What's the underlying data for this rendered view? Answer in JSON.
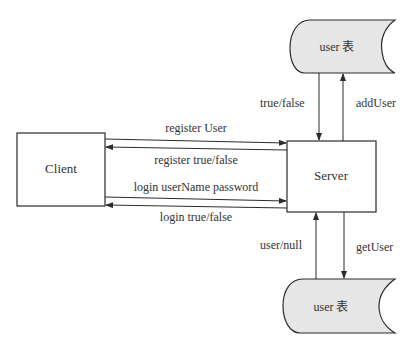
{
  "nodes": {
    "client": {
      "label": "Client"
    },
    "server": {
      "label": "Server"
    },
    "db_top": {
      "label": "user 表"
    },
    "db_bottom": {
      "label": "user 表"
    }
  },
  "edges": {
    "register_request": {
      "label": "register User",
      "from": "Client",
      "to": "Server"
    },
    "register_response": {
      "label": "register true/false",
      "from": "Server",
      "to": "Client"
    },
    "login_request": {
      "label": "login userName password",
      "from": "Client",
      "to": "Server"
    },
    "login_response": {
      "label": "login true/false",
      "from": "Server",
      "to": "Client"
    },
    "top_db_response": {
      "label": "true/false",
      "from": "user 表",
      "to": "Server"
    },
    "top_db_request": {
      "label": "addUser",
      "from": "Server",
      "to": "user 表"
    },
    "bottom_db_response": {
      "label": "user/null",
      "from": "user 表",
      "to": "Server"
    },
    "bottom_db_request": {
      "label": "getUser",
      "from": "Server",
      "to": "user 表"
    }
  },
  "colors": {
    "stroke": "#2b2b2b",
    "db_fill": "#e6e6e6",
    "background": "#ffffff"
  }
}
